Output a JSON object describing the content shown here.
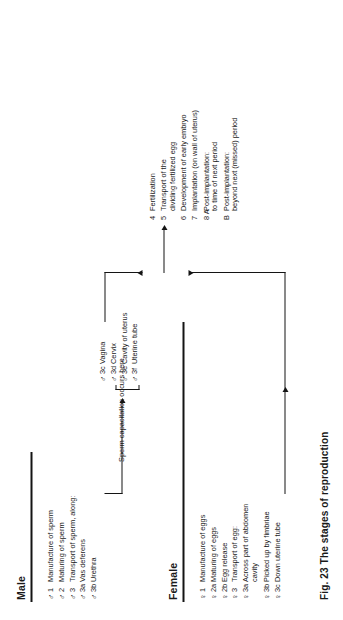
{
  "figure": {
    "caption": "Fig. 23  The stages of reproduction"
  },
  "columns": {
    "male_header": "Male",
    "female_header": "Female"
  },
  "symbols": {
    "male": "♂",
    "female": "♀"
  },
  "male_stages": [
    {
      "symbol": "♂",
      "number": "1",
      "text": "Manufacture of sperm"
    },
    {
      "symbol": "♂",
      "number": "2",
      "text": "Maturing of sperm"
    },
    {
      "symbol": "♂",
      "number": "3",
      "text": "Transport of sperm, along:"
    },
    {
      "symbol": "♂",
      "number": "3a",
      "text": "Vas deferens"
    },
    {
      "symbol": "♂",
      "number": "3b",
      "text": "Urethra"
    }
  ],
  "male_tract_stages": [
    {
      "symbol": "♂",
      "number": "3c",
      "text": "Vagina"
    },
    {
      "symbol": "♂",
      "number": "3d",
      "text": "Cervix"
    },
    {
      "symbol": "♂",
      "number": "3e",
      "text": "Cavity of uterus"
    },
    {
      "symbol": "♂",
      "number": "3f",
      "text": "Uterine tube"
    }
  ],
  "capacitation_note": {
    "line1": "Sperm capacitation",
    "line2": "occurs here"
  },
  "female_stages": [
    {
      "symbol": "♀",
      "number": "1",
      "text": "Manufacture of eggs",
      "text2": ""
    },
    {
      "symbol": "♀",
      "number": "2a",
      "text": "Maturing of eggs",
      "text2": ""
    },
    {
      "symbol": "♀",
      "number": "2b",
      "text": "Egg release",
      "text2": ""
    },
    {
      "symbol": "♀",
      "number": "3",
      "text": "Transport of egg:",
      "text2": ""
    },
    {
      "symbol": "♀",
      "number": "3a",
      "text": "Across part of abdomen",
      "text2": "cavity"
    }
  ],
  "female_stages_2": [
    {
      "symbol": "♀",
      "number": "3b",
      "text": "Picked up by fimbriae",
      "text2": ""
    },
    {
      "symbol": "♀",
      "number": "3c",
      "text": "Down uterine tube",
      "text2": ""
    }
  ],
  "joint_stages": [
    {
      "number": "4",
      "text": "Fertilization",
      "text2": ""
    },
    {
      "number": "5",
      "text": "Transport of the",
      "text2": "dividing fertilized egg"
    },
    {
      "number": "6",
      "text": "Development of early embryo",
      "text2": ""
    },
    {
      "number": "7",
      "text": "Implantation (on wall of uterus)",
      "text2": ""
    },
    {
      "number": "8 A",
      "text": "Post-implantation:",
      "text2": "to time of next period"
    },
    {
      "number": "B",
      "text": "Post-implantation:",
      "text2": "beyond next (missed) period"
    }
  ],
  "colors": {
    "ink": "#141414",
    "background": "#ffffff"
  }
}
